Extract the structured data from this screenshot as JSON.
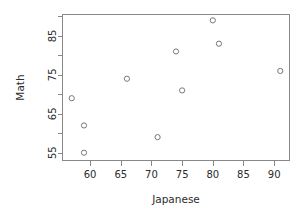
{
  "chart_data": {
    "type": "scatter",
    "title": "",
    "xlabel": "Japanese",
    "ylabel": "Math",
    "xlim": [
      55.5,
      92.5
    ],
    "ylim": [
      53.0,
      90.5
    ],
    "grid": false,
    "legend": null,
    "x_ticks_labeled": [
      60,
      65,
      70,
      75,
      80,
      85,
      90
    ],
    "x_tick_labels": [
      "60",
      "65",
      "70",
      "75",
      "80",
      "85",
      "90"
    ],
    "y_ticks_labeled": [
      55,
      65,
      75,
      85
    ],
    "y_tick_labels": [
      "55",
      "65",
      "75",
      "85"
    ],
    "y_ticks_minor": [
      60,
      70,
      80,
      90
    ],
    "marker": "open-circle",
    "marker_color": "#777777",
    "points": [
      {
        "x": 57,
        "y": 69
      },
      {
        "x": 59,
        "y": 62
      },
      {
        "x": 59,
        "y": 55
      },
      {
        "x": 66,
        "y": 74
      },
      {
        "x": 71,
        "y": 59
      },
      {
        "x": 74,
        "y": 81
      },
      {
        "x": 75,
        "y": 71
      },
      {
        "x": 80,
        "y": 89
      },
      {
        "x": 81,
        "y": 83
      },
      {
        "x": 91,
        "y": 76
      }
    ]
  },
  "axes": {
    "x_title": "Japanese",
    "y_title": "Math"
  }
}
